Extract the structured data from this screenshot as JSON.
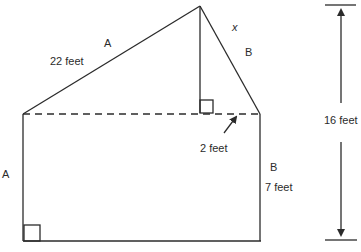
{
  "diagram": {
    "type": "composite-shape-measurement",
    "labels": {
      "slope_left_letter": "A",
      "slope_left_length": "22 feet",
      "slope_right_variable": "x",
      "slope_right_letter": "B",
      "left_side_letter": "A",
      "right_side_letter": "B",
      "right_side_length": "7 feet",
      "offset_length": "2 feet",
      "total_height": "16 feet"
    },
    "colors": {
      "line": "#2b2b2b",
      "background": "#ffffff"
    }
  }
}
